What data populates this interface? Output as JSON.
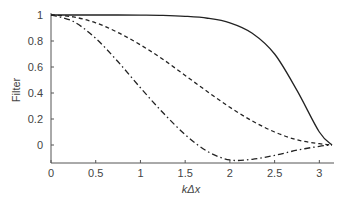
{
  "chart_data": {
    "type": "line",
    "title": "",
    "xlabel": "kΔx",
    "ylabel": "Filter",
    "xlim": [
      0,
      3.1416
    ],
    "ylim": [
      -0.15,
      1.0
    ],
    "xticks": [
      "0",
      "0.5",
      "1",
      "1.5",
      "2",
      "2.5",
      "3"
    ],
    "yticks": [
      "0",
      "0.2",
      "0.4",
      "0.6",
      "0.8",
      "1"
    ],
    "grid": false,
    "legend": "none",
    "x": [
      0,
      0.25,
      0.5,
      0.75,
      1.0,
      1.25,
      1.5,
      1.75,
      2.0,
      2.25,
      2.5,
      2.75,
      3.0,
      3.1416
    ],
    "series": [
      {
        "name": "solid",
        "style": "solid",
        "values": [
          1.0,
          1.0,
          1.0,
          1.0,
          0.999,
          0.997,
          0.99,
          0.975,
          0.94,
          0.86,
          0.7,
          0.42,
          0.1,
          0.0
        ]
      },
      {
        "name": "dashed",
        "style": "dashed",
        "values": [
          1.0,
          0.985,
          0.94,
          0.865,
          0.77,
          0.66,
          0.535,
          0.41,
          0.29,
          0.185,
          0.1,
          0.04,
          0.01,
          0.0
        ]
      },
      {
        "name": "dash-dot",
        "style": "dashdot",
        "values": [
          1.0,
          0.95,
          0.82,
          0.64,
          0.44,
          0.25,
          0.08,
          -0.05,
          -0.115,
          -0.11,
          -0.08,
          -0.04,
          -0.01,
          0.0
        ]
      }
    ]
  }
}
